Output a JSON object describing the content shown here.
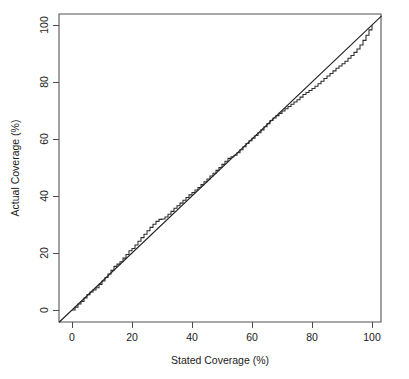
{
  "figure": {
    "width": 409,
    "height": 379,
    "background": "#ffffff"
  },
  "chart_data": {
    "type": "line",
    "title": "",
    "subtitle": "",
    "xlabel": "Stated Coverage (%)",
    "ylabel": "Actual Coverage (%)",
    "xlim": [
      -4.3,
      103.2
    ],
    "ylim": [
      -4.5,
      104.0
    ],
    "xticks": [
      0,
      20,
      40,
      60,
      80,
      100
    ],
    "yticks": [
      0,
      20,
      40,
      60,
      80,
      100
    ],
    "xtick_labels": [
      "0",
      "20",
      "40",
      "60",
      "80",
      "100"
    ],
    "ytick_labels": [
      "0",
      "20",
      "40",
      "60",
      "80",
      "100"
    ],
    "grid": false,
    "legend": null,
    "legend_position": "none",
    "axis_style": "r-base-box",
    "ytick_label_rotation": 90,
    "colors": {
      "reference_line": "#1c1c1c",
      "empirical_line": "#2b2b2b",
      "axis": "#4d4d4d",
      "box": "#555555",
      "text": "#1a1a1a"
    },
    "series": [
      {
        "name": "reference-diagonal",
        "style": "straight",
        "x": [
          -4.3,
          103.2
        ],
        "values": [
          -4.3,
          103.2
        ]
      },
      {
        "name": "empirical-calibration",
        "style": "step",
        "x": [
          0,
          1,
          2,
          3,
          4,
          5,
          6,
          7,
          8,
          9,
          10,
          11,
          12,
          13,
          14,
          15,
          16,
          17,
          18,
          19,
          20,
          21,
          22,
          23,
          24,
          25,
          26,
          27,
          28,
          29,
          30,
          31,
          32,
          33,
          34,
          35,
          36,
          37,
          38,
          39,
          40,
          41,
          42,
          43,
          44,
          45,
          46,
          47,
          48,
          49,
          50,
          51,
          52,
          53,
          54,
          55,
          56,
          57,
          58,
          59,
          60,
          61,
          62,
          63,
          64,
          65,
          66,
          67,
          68,
          69,
          70,
          71,
          72,
          73,
          74,
          75,
          76,
          77,
          78,
          79,
          80,
          81,
          82,
          83,
          84,
          85,
          86,
          87,
          88,
          89,
          90,
          91,
          92,
          93,
          94,
          95,
          96,
          97,
          98,
          99,
          100
        ],
        "values": [
          0,
          1.0,
          2.1,
          3.0,
          4.2,
          5.4,
          6.3,
          7.0,
          7.8,
          9.0,
          10.2,
          11.4,
          12.6,
          13.9,
          15.3,
          16.1,
          16.9,
          18.2,
          19.5,
          20.8,
          21.6,
          22.8,
          24.1,
          25.4,
          26.6,
          27.8,
          29.0,
          30.1,
          31.1,
          31.8,
          31.9,
          32.6,
          33.6,
          34.6,
          35.7,
          36.6,
          37.5,
          38.5,
          39.5,
          40.4,
          41.2,
          42.1,
          43.0,
          44.0,
          45.0,
          46.0,
          47.0,
          48.0,
          49.0,
          50.0,
          51.1,
          52.2,
          53.2,
          53.8,
          54.3,
          55.2,
          56.2,
          57.3,
          58.4,
          59.4,
          60.3,
          61.2,
          62.2,
          63.2,
          64.3,
          65.4,
          66.5,
          67.4,
          68.2,
          69.0,
          69.8,
          70.6,
          71.4,
          72.2,
          73.0,
          73.8,
          74.7,
          75.6,
          76.3,
          77.0,
          77.7,
          78.5,
          79.4,
          80.3,
          81.2,
          82.1,
          83.0,
          83.9,
          84.8,
          85.6,
          86.4,
          87.3,
          88.3,
          89.3,
          90.4,
          91.6,
          93.0,
          94.6,
          96.4,
          98.3,
          100.0
        ]
      }
    ],
    "annotations": []
  },
  "axis_titles": {
    "x": "Stated Coverage (%)",
    "y": "Actual Coverage (%)"
  }
}
